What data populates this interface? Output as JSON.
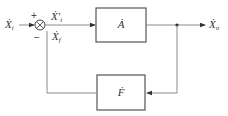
{
  "diagram": {
    "type": "feedback-block-diagram",
    "input": {
      "symbol": "Ẋ",
      "subscript": "i"
    },
    "error_signal": {
      "symbol": "Ẋ",
      "subscript": "i",
      "prime": "′"
    },
    "feedback_signal": {
      "symbol": "Ẋ",
      "subscript": "f"
    },
    "output": {
      "symbol": "Ẋ",
      "subscript": "o"
    },
    "summing_junction": {
      "plus_sign": "+",
      "minus_sign": "−"
    },
    "forward_block": {
      "label": "Ȧ"
    },
    "feedback_block": {
      "label": "Ḟ"
    }
  },
  "colors": {
    "line": "#8a8a8a",
    "block_border": "#555555",
    "text": "#333333"
  }
}
